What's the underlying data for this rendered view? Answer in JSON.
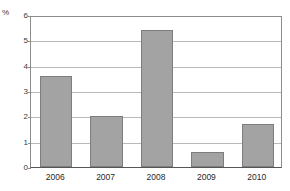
{
  "chart_data": {
    "type": "bar",
    "title": "",
    "subtitle": "",
    "xlabel": "",
    "ylabel": "%",
    "categories": [
      "2006",
      "2007",
      "2008",
      "2009",
      "2010"
    ],
    "values": [
      3.6,
      2.0,
      5.4,
      0.6,
      1.7
    ],
    "series": [
      {
        "name": "",
        "values": [
          3.6,
          2.0,
          5.4,
          0.6,
          1.7
        ]
      }
    ],
    "ylim": [
      0,
      6
    ],
    "y_ticks": [
      "0",
      "1",
      "2",
      "3",
      "4",
      "5",
      "6"
    ],
    "y_tick_values": [
      0,
      1,
      2,
      3,
      4,
      5,
      6
    ],
    "grid": true,
    "grid_orientation": "horizontal",
    "legend": false,
    "legend_position": "none",
    "annotations": [],
    "colors": {
      "bar_fill": "#a3a3a3",
      "bar_border": "#7d7d7d",
      "gridline": "#b9b9b9",
      "axis": "#8c8c8c",
      "baseline": "#555555",
      "tick_text": "#3a3a3a",
      "category_text": "#1f1f1f",
      "background": "#ffffff"
    }
  }
}
